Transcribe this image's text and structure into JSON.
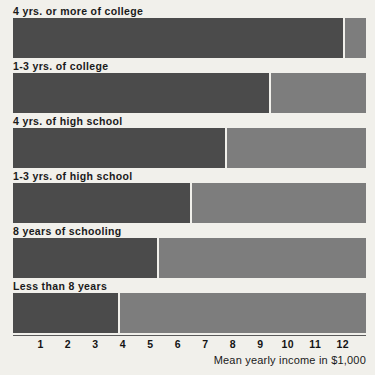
{
  "chart_data": {
    "type": "bar",
    "orientation": "horizontal",
    "title": "",
    "subtitle": "",
    "xlabel": "Mean yearly income in $1,000",
    "ylabel": "",
    "xlim": [
      0,
      12.85
    ],
    "xticks": [
      1,
      2,
      3,
      4,
      5,
      6,
      7,
      8,
      9,
      10,
      11,
      12
    ],
    "xticklabels": [
      "1",
      "2",
      "3",
      "4",
      "5",
      "6",
      "7",
      "8",
      "9",
      "10",
      "11",
      "12"
    ],
    "grid": false,
    "legend": false,
    "categories": [
      "4 yrs. or more of college",
      "1-3 yrs. of college",
      "4 yrs. of high school",
      "1-3 yrs. of high school",
      "8 years of schooling",
      "Less than 8 years"
    ],
    "values": [
      12.1,
      9.4,
      7.8,
      6.5,
      5.3,
      3.9
    ],
    "units": "$1,000 per year",
    "bars": [
      {
        "category": "4 yrs. or more of college",
        "value": 12.1
      },
      {
        "category": "1-3 yrs. of college",
        "value": 9.4
      },
      {
        "category": "4 yrs. of high school",
        "value": 7.8
      },
      {
        "category": "1-3 yrs. of high school",
        "value": 6.5
      },
      {
        "category": "8 years of schooling",
        "value": 5.3
      },
      {
        "category": "Less than 8 years",
        "value": 3.9
      }
    ],
    "colors": {
      "bar_fill": "#4b4b4b",
      "bar_track": "#7d7d7d",
      "background": "#f1f0eb",
      "text": "#1a1a1a"
    }
  }
}
